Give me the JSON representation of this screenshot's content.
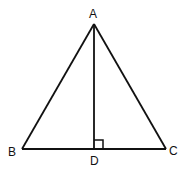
{
  "diagram": {
    "type": "geometry",
    "points": {
      "A": {
        "label": "A",
        "x": 94,
        "y": 24
      },
      "B": {
        "label": "B",
        "x": 22,
        "y": 149
      },
      "C": {
        "label": "C",
        "x": 166,
        "y": 149
      },
      "D": {
        "label": "D",
        "x": 94,
        "y": 149
      }
    },
    "segments": [
      "AB",
      "AC",
      "BC",
      "AD"
    ],
    "right_angle_at": "D",
    "stroke_color": "#111111"
  }
}
